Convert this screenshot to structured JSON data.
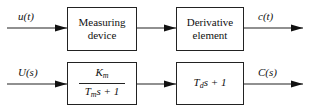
{
  "diagram": {
    "time_domain": {
      "input_label": "u(t)",
      "block1": {
        "line1": "Measuring",
        "line2": "device"
      },
      "block2": {
        "line1": "Derivative",
        "line2": "element"
      },
      "output_label": "c(t)"
    },
    "s_domain": {
      "input_label": "U(s)",
      "block1": {
        "numerator_base": "K",
        "numerator_sub": "m",
        "denominator_base": "T",
        "denominator_sub": "m",
        "denominator_rest": "s + 1"
      },
      "block2": {
        "base": "T",
        "sub": "d",
        "rest": "s + 1"
      },
      "output_label": "C(s)"
    }
  }
}
